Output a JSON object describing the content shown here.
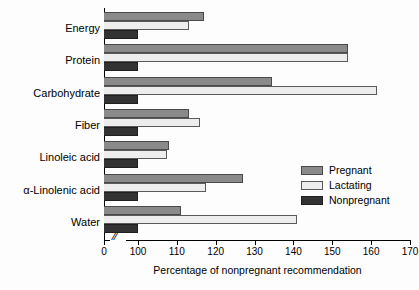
{
  "chart_data": {
    "type": "bar",
    "orientation": "horizontal",
    "title": "",
    "xlabel": "Percentage of nonpregnant recommendation",
    "ylabel": "",
    "xlim": [
      100,
      170
    ],
    "axis_break": {
      "present": true,
      "symbol": "//",
      "from": 0,
      "to": 100
    },
    "grid": false,
    "legend_position": "right-middle",
    "xticks": [
      0,
      100,
      110,
      120,
      130,
      140,
      150,
      160,
      170
    ],
    "xtick_labels": [
      "0",
      "100",
      "110",
      "120",
      "130",
      "140",
      "150",
      "160",
      "170"
    ],
    "categories": [
      "Energy",
      "Protein",
      "Carbohydrate",
      "Fiber",
      "Linoleic acid",
      "α-Linolenic acid",
      "Water"
    ],
    "series": [
      {
        "name": "Pregnant",
        "color": "#8a8a8a",
        "values": [
          117,
          154,
          134.5,
          113,
          108,
          127,
          111
        ]
      },
      {
        "name": "Lactating",
        "color": "#ededed",
        "values": [
          113,
          154,
          161.5,
          116,
          107.5,
          117.5,
          141
        ]
      },
      {
        "name": "Nonpregnant",
        "color": "#333333",
        "values": [
          100,
          100,
          100,
          100,
          100,
          100,
          100
        ]
      }
    ]
  },
  "legend": {
    "entries": [
      {
        "label": "Pregnant",
        "swatch": "pregnant"
      },
      {
        "label": "Lactating",
        "swatch": "lactating"
      },
      {
        "label": "Nonpregnant",
        "swatch": "nonpregnant"
      }
    ]
  }
}
